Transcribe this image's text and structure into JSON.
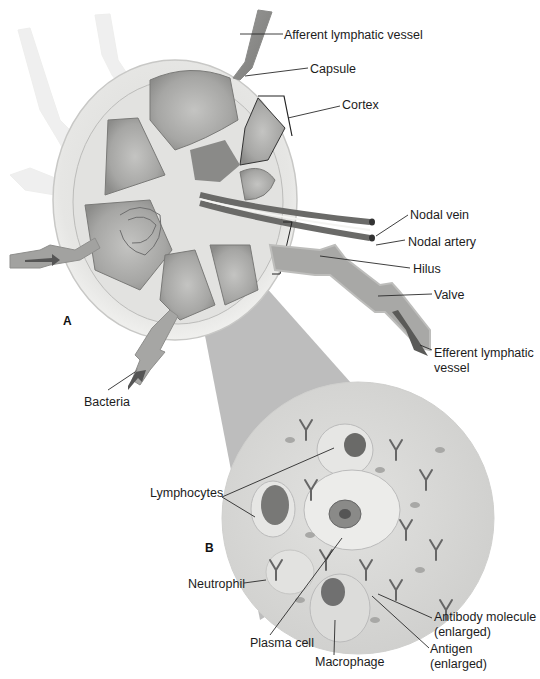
{
  "figure": {
    "panel_a_letter": "A",
    "panel_b_letter": "B",
    "caption_partial": "Figure 10-... (caption cut off at bottom edge, illegible)"
  },
  "panel_a_labels": {
    "afferent_vessel": "Afferent lymphatic vessel",
    "capsule": "Capsule",
    "cortex": "Cortex",
    "nodal_vein": "Nodal vein",
    "nodal_artery": "Nodal artery",
    "hilus": "Hilus",
    "valve": "Valve",
    "efferent_vessel_line1": "Efferent lymphatic",
    "efferent_vessel_line2": "vessel",
    "bacteria": "Bacteria"
  },
  "panel_b_labels": {
    "lymphocytes": "Lymphocytes",
    "neutrophil": "Neutrophil",
    "plasma_cell": "Plasma cell",
    "macrophage": "Macrophage",
    "antibody_line1": "Antibody molecule",
    "antibody_line2": "(enlarged)",
    "antigen_line1": "Antigen",
    "antigen_line2": "(enlarged)"
  },
  "colors": {
    "capsule": "#e9e9e7",
    "cortex": "#a9a9a7",
    "medulla": "#8a8a88",
    "vessel_dark": "#6e6e6e",
    "lens_cone": "#bdbdbd",
    "magnified_bg": "#d8d8d6",
    "leader_line": "#2a2a2a"
  }
}
